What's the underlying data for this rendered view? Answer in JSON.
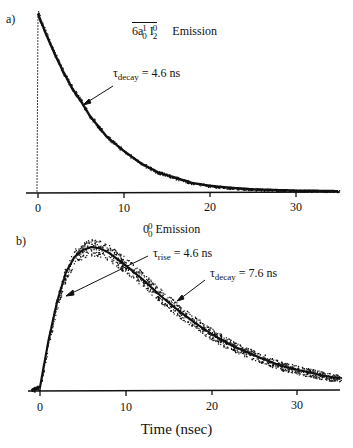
{
  "chart_data": [
    {
      "type": "scatter",
      "panel": "a)",
      "title": "6a₀¹ I₂⁰ Emission",
      "title_parts": {
        "base1": "6a",
        "sup1": "1",
        "sub1": "0",
        "base2": " I",
        "sup2": "0",
        "sub2": "2",
        "suffix": "Emission"
      },
      "annotations": [
        {
          "text": "τdecay = 4.6 ns",
          "symbol": "τ",
          "subscript": "decay",
          "value": "= 4.6 ns",
          "arrow_to_x_ns": 7.0
        }
      ],
      "xlabel": "",
      "ylabel": "",
      "xlim": [
        -4,
        35
      ],
      "xticks": [
        0,
        10,
        20,
        30
      ],
      "grid": false,
      "series": [
        {
          "name": "emission (single exponential decay)",
          "tau_decay_ns": 4.6,
          "x": [
            0,
            1,
            2,
            3,
            4,
            5,
            6,
            7,
            8,
            10,
            12,
            14,
            16,
            18,
            20,
            22,
            25,
            30,
            35
          ],
          "y": [
            1.0,
            0.88,
            0.77,
            0.67,
            0.58,
            0.51,
            0.43,
            0.37,
            0.31,
            0.23,
            0.16,
            0.11,
            0.08,
            0.05,
            0.035,
            0.025,
            0.015,
            0.008,
            0.005
          ]
        }
      ]
    },
    {
      "type": "scatter",
      "panel": "b)",
      "title": "0₀⁰ Emission",
      "title_parts": {
        "base": "0",
        "sup": "0",
        "sub": "0",
        "suffix": "Emission"
      },
      "annotations": [
        {
          "text": "τrise = 4.6 ns",
          "symbol": "τ",
          "subscript": "rise",
          "value": "= 4.6 ns",
          "arrow_to_x_ns": 3.0
        },
        {
          "text": "τdecay = 7.6 ns",
          "symbol": "τ",
          "subscript": "decay",
          "value": "= 7.6 ns",
          "arrow_to_x_ns": 14.0
        }
      ],
      "xlabel": "Time (nsec)",
      "ylabel": "",
      "xlim": [
        -4,
        35
      ],
      "xticks": [
        0,
        10,
        20,
        30
      ],
      "grid": false,
      "series": [
        {
          "name": "emission (rise + decay)",
          "tau_rise_ns": 4.6,
          "tau_decay_ns": 7.6,
          "x": [
            -1,
            0,
            1,
            2,
            3,
            4,
            5,
            6,
            7,
            8,
            10,
            12,
            14,
            16,
            18,
            20,
            22,
            25,
            28,
            30,
            33,
            35
          ],
          "y": [
            0,
            0.02,
            0.35,
            0.62,
            0.82,
            0.93,
            0.98,
            1.0,
            0.99,
            0.96,
            0.87,
            0.77,
            0.66,
            0.56,
            0.47,
            0.39,
            0.32,
            0.24,
            0.17,
            0.14,
            0.1,
            0.08
          ]
        }
      ]
    }
  ],
  "panels": {
    "a": {
      "letter": "a)",
      "title_base1": "6a",
      "title_sup1": "1",
      "title_sub1": "0",
      "title_base2": "I",
      "title_sup2": "0",
      "title_sub2": "2",
      "title_suffix": "Emission",
      "tau_symbol": "τ",
      "tau_sub": "decay",
      "tau_value": "=  4.6 ns",
      "ticks": [
        "0",
        "10",
        "20",
        "30"
      ]
    },
    "b": {
      "letter": "b)",
      "title_base": "0",
      "title_sup": "0",
      "title_sub": "0",
      "title_suffix": "Emission",
      "rise_symbol": "τ",
      "rise_sub": "rise",
      "rise_value": "=  4.6 ns",
      "decay_symbol": "τ",
      "decay_sub": "decay",
      "decay_value": "=  7.6 ns",
      "ticks": [
        "0",
        "10",
        "20",
        "30"
      ],
      "xlabel": "Time (nsec)"
    }
  },
  "colors": {
    "ink": "#111111",
    "background": "#ffffff"
  }
}
